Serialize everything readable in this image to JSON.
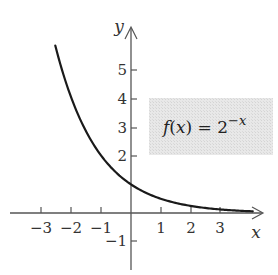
{
  "chart_data": {
    "type": "line",
    "title": "",
    "function": "f(x) = 2^(-x)",
    "xlabel": "x",
    "ylabel": "y",
    "xlim": [
      -4.2,
      4.4
    ],
    "ylim": [
      -2.0,
      6.7
    ],
    "x_ticks": [
      -3,
      -2,
      -1,
      1,
      2,
      3
    ],
    "y_ticks": [
      -1,
      2,
      3,
      4,
      5
    ],
    "grid": false,
    "legend": null,
    "annotation": {
      "text_parts": [
        "f",
        "(",
        "x",
        ") = 2",
        "−x"
      ],
      "position": "right, between y=2 and y=4"
    },
    "series": [
      {
        "name": "f(x) = 2^(-x)",
        "x": [
          -2.55,
          -2,
          -1,
          0,
          1,
          2,
          3,
          4.1
        ],
        "values": [
          5.86,
          4,
          2,
          1,
          0.5,
          0.25,
          0.125,
          0.058
        ]
      }
    ]
  },
  "labels": {
    "x_axis": "x",
    "y_axis": "y",
    "x_tick_labels": [
      "−3",
      "−2",
      "−1",
      "1",
      "2",
      "3"
    ],
    "y_tick_labels": [
      "5",
      "4",
      "3",
      "2",
      "−1"
    ],
    "fn_f": "f",
    "fn_open": "(",
    "fn_x": "x",
    "fn_close_eq": ") = 2",
    "fn_exp": "−x"
  },
  "colors": {
    "curve": "#1a1a1a",
    "axis": "#555555",
    "label_box": "#e6e6e6"
  }
}
